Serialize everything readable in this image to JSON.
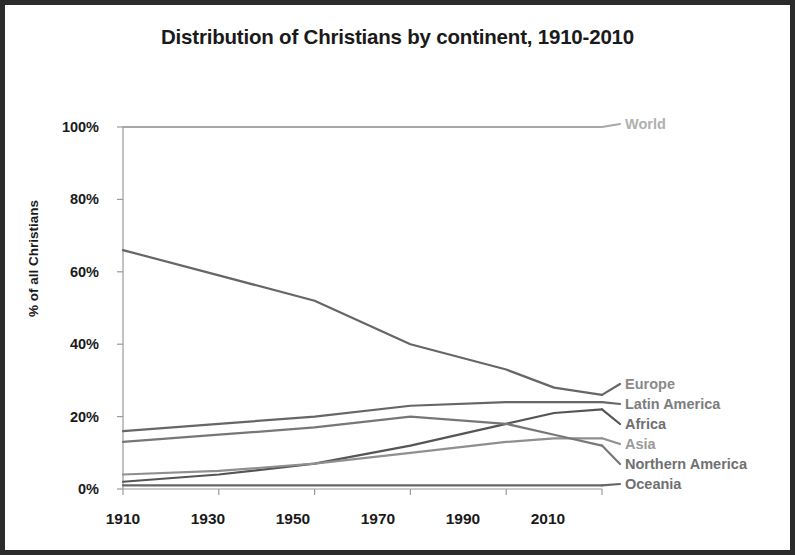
{
  "chart_data": {
    "type": "line",
    "title": "Distribution of Christians by continent, 1910-2010",
    "xlabel": "",
    "ylabel": "% of all Christians",
    "x": [
      1910,
      1930,
      1950,
      1970,
      1990,
      2000,
      2010
    ],
    "xticks": [
      "1910",
      "1930",
      "1950",
      "1970",
      "1990",
      "2010"
    ],
    "xtick_values": [
      1910,
      1930,
      1950,
      1970,
      1990,
      2010
    ],
    "yticks": [
      "0%",
      "20%",
      "40%",
      "60%",
      "80%",
      "100%"
    ],
    "ytick_values": [
      0,
      20,
      40,
      60,
      80,
      100
    ],
    "ylim": [
      0,
      100
    ],
    "xlim": [
      1910,
      2010
    ],
    "grid": false,
    "legend_position": "right-inline-labels",
    "series": [
      {
        "name": "World",
        "label": "World",
        "color": "#a8a8a8",
        "values": [
          100,
          100,
          100,
          100,
          100,
          100,
          100
        ]
      },
      {
        "name": "Europe",
        "label": "Europe",
        "color": "#666666",
        "values": [
          66,
          59,
          52,
          40,
          33,
          28,
          26
        ]
      },
      {
        "name": "Latin America",
        "label": "Latin America",
        "color": "#666666",
        "values": [
          16,
          18,
          20,
          23,
          24,
          24,
          24
        ]
      },
      {
        "name": "Africa",
        "label": "Africa",
        "color": "#555555",
        "values": [
          2,
          4,
          7,
          12,
          18,
          21,
          22
        ]
      },
      {
        "name": "Asia",
        "label": "Asia",
        "color": "#8f8f8f",
        "values": [
          4,
          5,
          7,
          10,
          13,
          14,
          14
        ]
      },
      {
        "name": "Northern America",
        "label": "Northern America",
        "color": "#777777",
        "values": [
          13,
          15,
          17,
          20,
          18,
          15,
          12
        ]
      },
      {
        "name": "Oceania",
        "label": "Oceania",
        "color": "#666666",
        "values": [
          1,
          1,
          1,
          1,
          1,
          1,
          1
        ]
      }
    ]
  },
  "axes": {
    "ytick_labels": [
      "100%",
      "80%",
      "60%",
      "40%",
      "20%",
      "0%"
    ],
    "xtick_labels": [
      "1910",
      "1930",
      "1950",
      "1970",
      "1990",
      "2010"
    ]
  },
  "labels": {
    "world": "World",
    "europe": "Europe",
    "latin_america": "Latin America",
    "africa": "Africa",
    "asia": "Asia",
    "northern_america": "Northern America",
    "oceania": "Oceania"
  },
  "colors": {
    "border": "#2b2b2b",
    "text": "#1a1a1a",
    "label_gray": "#8a8a8a",
    "axis": "#9a9a9a"
  }
}
